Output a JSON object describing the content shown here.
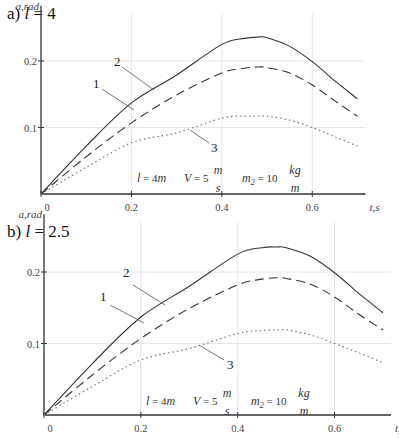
{
  "chart_data": [
    {
      "type": "line",
      "panel_label": "a)",
      "title_var": "l",
      "title_eq": " = 4",
      "xlabel": "t, s",
      "ylabel": "a, rad",
      "xlim": [
        0,
        0.7
      ],
      "ylim": [
        0,
        0.25
      ],
      "xticks": [
        "0",
        "0.2",
        "0.4",
        "0.6"
      ],
      "xtick_values": [
        0,
        0.2,
        0.4,
        0.6
      ],
      "yticks": [
        "0.1",
        "0.2"
      ],
      "ytick_values": [
        0.1,
        0.2
      ],
      "grid": true,
      "x": [
        0,
        0.1,
        0.2,
        0.3,
        0.4,
        0.45,
        0.48,
        0.5,
        0.55,
        0.6,
        0.65,
        0.7
      ],
      "series": [
        {
          "name": "1",
          "style": "dashed",
          "values": [
            0,
            0.056,
            0.107,
            0.149,
            0.182,
            0.189,
            0.191,
            0.19,
            0.182,
            0.164,
            0.14,
            0.117
          ]
        },
        {
          "name": "2",
          "style": "solid",
          "values": [
            0,
            0.072,
            0.137,
            0.179,
            0.225,
            0.234,
            0.236,
            0.235,
            0.222,
            0.199,
            0.17,
            0.143
          ]
        },
        {
          "name": "3",
          "style": "dotted",
          "values": [
            0,
            0.04,
            0.077,
            0.092,
            0.114,
            0.117,
            0.117,
            0.117,
            0.111,
            0.1,
            0.086,
            0.072
          ]
        }
      ],
      "annotations": {
        "l": {
          "var": "l",
          "eq": " = 4",
          "unit": "m"
        },
        "V": {
          "var": "V",
          "eq": " = 5",
          "num": "m",
          "den": "s"
        },
        "m2": {
          "var": "m",
          "sub": "2",
          "eq": " = 10",
          "num": "kg",
          "den": "m"
        }
      },
      "curve_labels": [
        "1",
        "2",
        "3"
      ]
    },
    {
      "type": "line",
      "panel_label": "b)",
      "title_var": "l",
      "title_eq": " = 2.5",
      "xlabel": "t, s",
      "ylabel": "a, rad",
      "xlim": [
        0,
        0.7
      ],
      "ylim": [
        0,
        0.25
      ],
      "xticks": [
        "0",
        "0.2",
        "0.4",
        "0.6"
      ],
      "xtick_values": [
        0,
        0.2,
        0.4,
        0.6
      ],
      "yticks": [
        "0.1",
        "0.2"
      ],
      "ytick_values": [
        0.1,
        0.2
      ],
      "grid": true,
      "x": [
        0,
        0.1,
        0.2,
        0.3,
        0.4,
        0.45,
        0.48,
        0.5,
        0.55,
        0.6,
        0.65,
        0.7
      ],
      "series": [
        {
          "name": "1",
          "style": "dashed",
          "values": [
            0,
            0.056,
            0.107,
            0.149,
            0.182,
            0.19,
            0.192,
            0.191,
            0.183,
            0.165,
            0.141,
            0.119
          ]
        },
        {
          "name": "2",
          "style": "solid",
          "values": [
            0,
            0.072,
            0.137,
            0.18,
            0.225,
            0.234,
            0.235,
            0.234,
            0.222,
            0.199,
            0.17,
            0.143
          ]
        },
        {
          "name": "3",
          "style": "dotted",
          "values": [
            0,
            0.04,
            0.077,
            0.093,
            0.114,
            0.118,
            0.119,
            0.119,
            0.112,
            0.1,
            0.087,
            0.073
          ]
        }
      ],
      "annotations": {
        "l": {
          "var": "l",
          "eq": " = 4",
          "unit": "m"
        },
        "V": {
          "var": "V",
          "eq": " = 5",
          "num": "m",
          "den": "s"
        },
        "m2": {
          "var": "m",
          "sub": "2",
          "eq": " = 10",
          "num": "kg",
          "den": "m"
        }
      },
      "curve_labels": [
        "1",
        "2",
        "3"
      ]
    }
  ]
}
